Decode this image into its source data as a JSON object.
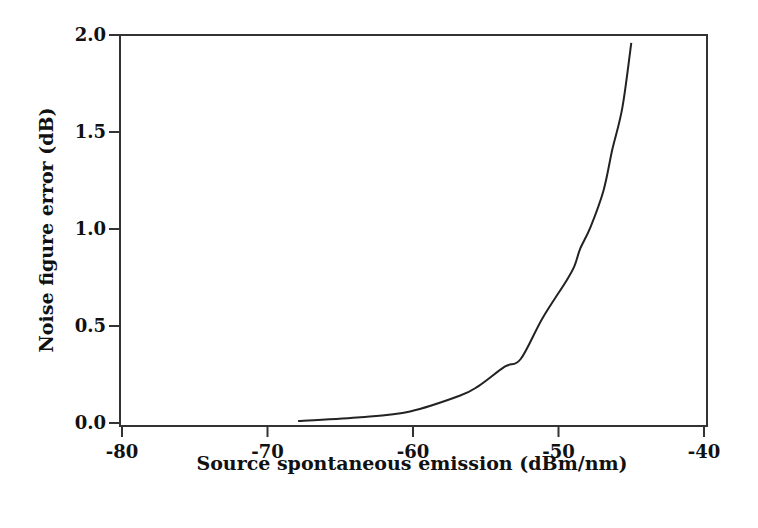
{
  "chart_data": {
    "type": "line",
    "title": "",
    "xlabel": "Source spontaneous emission (dBm/nm)",
    "ylabel": "Noise figure error (dB)",
    "xlim": [
      -80,
      -40
    ],
    "ylim": [
      0,
      2.0
    ],
    "xticks": [
      -80,
      -70,
      -60,
      -50,
      -40
    ],
    "xtick_labels": [
      "-80",
      "-70",
      "-60",
      "-50",
      "-40"
    ],
    "yticks": [
      0.0,
      0.5,
      1.0,
      1.5,
      2.0
    ],
    "ytick_labels": [
      "0.0",
      "0.5",
      "1.0",
      "1.5",
      "2.0"
    ],
    "grid": false,
    "legend": null,
    "series": [
      {
        "name": "Noise figure error",
        "color": "#222222",
        "x": [
          -67.9,
          -63.6,
          -60.2,
          -56.8,
          -55.5,
          -53.7,
          -52.6,
          -51.1,
          -49.4,
          -48.9,
          -48.5,
          -47.8,
          -46.9,
          -46.3,
          -45.6,
          -45.0
        ],
        "y": [
          0.01,
          0.03,
          0.06,
          0.14,
          0.19,
          0.29,
          0.33,
          0.54,
          0.74,
          0.81,
          0.9,
          1.01,
          1.2,
          1.41,
          1.63,
          1.96
        ]
      }
    ]
  }
}
